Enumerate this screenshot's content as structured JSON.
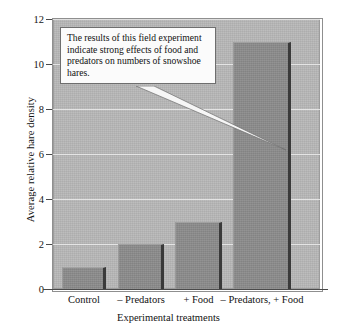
{
  "chart_data": {
    "type": "bar",
    "title": "",
    "categories": [
      "Control",
      "– Predators",
      "+ Food",
      "– Predators, + Food"
    ],
    "values": [
      1,
      2,
      3,
      11
    ],
    "series": [
      {
        "name": "Average relative hare density",
        "values": [
          1,
          2,
          3,
          11
        ]
      }
    ],
    "xlabel": "Experimental treatments",
    "ylabel": "Average relative hare density",
    "ylim": [
      0,
      12
    ],
    "yticks": [
      0,
      2,
      4,
      6,
      8,
      10,
      12
    ],
    "ytick_labels": [
      "0",
      "2",
      "4",
      "6",
      "8",
      "10",
      "12"
    ],
    "grid": true,
    "legend": false,
    "annotations": [
      {
        "text": "The results of this field experiment indicate strong effects of food and predators on numbers of snowshoe hares.",
        "points_to_category": "– Predators, + Food"
      }
    ],
    "colors": {
      "bar_fill": "#8c8c8c",
      "bar_edge": "#3a3a3a",
      "plot_background": "#b9b9b9",
      "gridline": "#ececec",
      "axis": "#4a4a4a",
      "callout_background": "#fbfbfb",
      "callout_border": "#6e6e6e",
      "text": "#111111"
    }
  },
  "callout": {
    "text": "The results of this field experiment indicate strong effects of food and predators on numbers of snowshoe hares."
  }
}
